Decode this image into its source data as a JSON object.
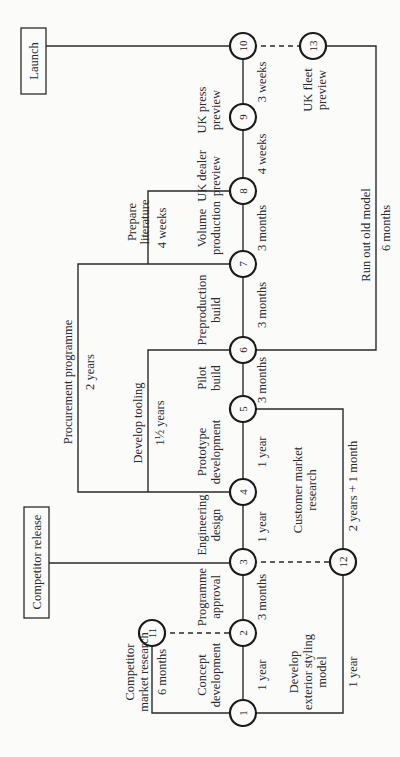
{
  "diagram": {
    "type": "network-diagram",
    "orientation": "rotated-90-ccw",
    "milestones": [
      {
        "id": "launch",
        "label": "Launch"
      },
      {
        "id": "competitor-release",
        "label": "Competitor release"
      }
    ],
    "nodes": [
      {
        "id": 1,
        "label": "1",
        "x": 243,
        "y": 713
      },
      {
        "id": 2,
        "label": "2",
        "x": 243,
        "y": 633
      },
      {
        "id": 3,
        "label": "3",
        "x": 243,
        "y": 562
      },
      {
        "id": 4,
        "label": "4",
        "x": 243,
        "y": 492
      },
      {
        "id": 5,
        "label": "5",
        "x": 243,
        "y": 409
      },
      {
        "id": 6,
        "label": "6",
        "x": 243,
        "y": 350
      },
      {
        "id": 7,
        "label": "7",
        "x": 243,
        "y": 264
      },
      {
        "id": 8,
        "label": "8",
        "x": 243,
        "y": 191
      },
      {
        "id": 9,
        "label": "9",
        "x": 243,
        "y": 117
      },
      {
        "id": 10,
        "label": "10",
        "x": 243,
        "y": 46
      },
      {
        "id": 11,
        "label": "11",
        "x": 152,
        "y": 633
      },
      {
        "id": 12,
        "label": "12",
        "x": 343,
        "y": 562
      },
      {
        "id": 13,
        "label": "13",
        "x": 313,
        "y": 46
      }
    ],
    "activities": [
      {
        "from": 1,
        "to": 2,
        "name": "Concept development",
        "duration": "1 year"
      },
      {
        "from": 2,
        "to": 3,
        "name": "Programme approval",
        "duration": "3 months"
      },
      {
        "from": 3,
        "to": 4,
        "name": "Engineering design",
        "duration": "1 year"
      },
      {
        "from": 4,
        "to": 5,
        "name": "Prototype development",
        "duration": "1 year"
      },
      {
        "from": 5,
        "to": 6,
        "name": "Pilot build",
        "duration": "3 months"
      },
      {
        "from": 6,
        "to": 7,
        "name": "Preproduction build",
        "duration": "3 months"
      },
      {
        "from": 7,
        "to": 8,
        "name": "Volume production",
        "duration": "3 months"
      },
      {
        "from": 8,
        "to": 9,
        "name": "UK dealer preview",
        "duration": "4 weeks"
      },
      {
        "from": 9,
        "to": 10,
        "name": "UK press preview",
        "duration": "3 weeks"
      },
      {
        "from": 1,
        "to": 11,
        "name": "Competitor market research",
        "duration": "6 months"
      },
      {
        "from": 1,
        "to": 12,
        "name": "Develop exterior styling model",
        "duration": "1 year"
      },
      {
        "from": 5,
        "to": 12,
        "name": "Customer market research",
        "duration": "2 years + 1 month"
      },
      {
        "from": 4,
        "to": 7,
        "name": "Procurement programme",
        "duration": "2 years"
      },
      {
        "from": 4,
        "to": 6,
        "name": "Develop tooling",
        "duration": "1½ years"
      },
      {
        "from": 7,
        "to": 8,
        "name": "Prepare literature",
        "duration": "4 weeks"
      },
      {
        "from": 6,
        "to": 13,
        "name": "Run out old model",
        "duration": "6 months"
      },
      {
        "from": 13,
        "to": 10,
        "name": "UK fleet preview",
        "duration": ""
      }
    ],
    "dummy_links": [
      {
        "from": 11,
        "to": 2
      },
      {
        "from": 12,
        "to": 3
      },
      {
        "from": 13,
        "to": 10
      }
    ]
  },
  "labels": {
    "launch": "Launch",
    "competitor_release": "Competitor release",
    "uk_press_1": "UK press",
    "uk_press_2": "preview",
    "three_weeks": "3 weeks",
    "uk_fleet_1": "UK fleet",
    "uk_fleet_2": "preview",
    "uk_dealer_1": "UK dealer",
    "uk_dealer_2": "preview",
    "four_weeks_a": "4 weeks",
    "run_out": "Run out old model",
    "six_months_b": "6 months",
    "prepare_1": "Prepare",
    "prepare_2": "literature",
    "four_weeks_b": "4 weeks",
    "volume_1": "Volume",
    "volume_2": "production",
    "three_months_c": "3 months",
    "preprod_1": "Preproduction",
    "preprod_2": "build",
    "three_months_b": "3 months",
    "procurement": "Procurement programme",
    "two_years": "2 years",
    "tooling": "Develop tooling",
    "one_half_years": "1½ years",
    "pilot_1": "Pilot",
    "pilot_2": "build",
    "three_months_a": "3 months",
    "prototype_1": "Prototype",
    "prototype_2": "development",
    "one_year_c": "1 year",
    "customer_1": "Customer market",
    "customer_2": "research",
    "two_years_one_month": "2 years + 1 month",
    "engineering_1": "Engineering",
    "engineering_2": "design",
    "one_year_b": "1 year",
    "programme_1": "Programme",
    "programme_2": "approval",
    "three_months_d": "3 months",
    "competitor_mr_1": "Competitor",
    "competitor_mr_2": "market research",
    "six_months_a": "6 months",
    "concept_1": "Concept",
    "concept_2": "development",
    "one_year_a": "1 year",
    "styling_1": "Develop",
    "styling_2": "exterior styling",
    "styling_3": "model",
    "one_year_d": "1 year"
  }
}
